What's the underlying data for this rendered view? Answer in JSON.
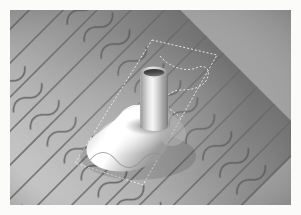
{
  "figure": {
    "rendering": "grayscale shaded 3D illustration",
    "border": {
      "color": "#fbfbfa",
      "width_px": 10
    }
  },
  "canvas": {
    "width": 301,
    "height": 215,
    "scene_width": 281,
    "scene_height": 195
  },
  "palette": {
    "mat": "#fbfbfa",
    "tile_highlight": "#c8c8c8",
    "tile_midtone": "#a6a6a6",
    "tile_shadow": "#7e7e7e",
    "tile_deep_shadow": "#6a6a6a",
    "tile_seam": "#555555",
    "pipe_highlight": "#f2f2f2",
    "pipe_midtone": "#b8b8b8",
    "pipe_shadow": "#8a8a8a",
    "pipe_bore_dark": "#3d3d3d",
    "pipe_rim": "#dedede",
    "flashing_bright": "#ffffff",
    "flashing_mid": "#c4c4c4",
    "flashing_shadow": "#8f8f8f",
    "dashed_outline": "#f0f0f0"
  },
  "roof": {
    "name": "barrel-tile-roof",
    "tile_style": "spanish-barrel",
    "tile_direction_deg": -45,
    "tile_pitch_px": 24,
    "course_pitch_px": 34,
    "tile_count_visible": 14
  },
  "pipe": {
    "name": "vent-pipe",
    "shape": "cylinder",
    "top_center": {
      "x": 144,
      "y": 62
    },
    "bottom_center": {
      "x": 140,
      "y": 122
    },
    "radius_x": 14,
    "radius_y": 5,
    "height_px": 60,
    "open_top": true
  },
  "flashing": {
    "name": "pipe-flashing-skirt",
    "shape": "flared conical skirt",
    "apex": {
      "x": 140,
      "y": 112
    },
    "spread_px": 78,
    "bottom_y": 168
  },
  "annotations": {
    "outline": {
      "name": "flashing-footprint-outline",
      "style": "dashed",
      "dash": "2 2",
      "stroke_width": 1,
      "color": "#f0f0f0",
      "corners": [
        {
          "x": 152,
          "y": 40
        },
        {
          "x": 217,
          "y": 55
        },
        {
          "x": 143,
          "y": 185
        },
        {
          "x": 75,
          "y": 163
        }
      ]
    },
    "inner_contour": {
      "name": "flashing-profile-contour",
      "style": "dashed",
      "description": "dashed contour tracing the shaped upper edge of the flashing over the tile ridges"
    }
  },
  "labels": {
    "alt_text": "Grayscale illustration of a cylindrical vent pipe rising through a Spanish barrel tile roof, surrounded by a bright conical flashing skirt, with a dashed rectangular outline marking the flashing footprint."
  }
}
